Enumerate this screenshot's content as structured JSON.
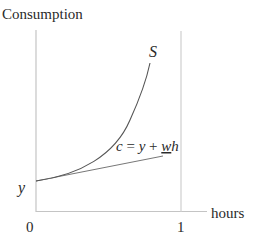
{
  "diagram": {
    "y_axis_label": "Consumption",
    "x_axis_label": "hours",
    "origin_label": "0",
    "x_tick_label": "1",
    "intercept_label": "y",
    "curve_label": "S",
    "line_label": {
      "c": "c",
      "eq": " = ",
      "y": "y",
      "plus": " + ",
      "w": "w",
      "h": "h"
    },
    "colors": {
      "axis": "#c8c8c8",
      "curve": "#555555",
      "line": "#777777",
      "text": "#2a2a2a"
    }
  }
}
